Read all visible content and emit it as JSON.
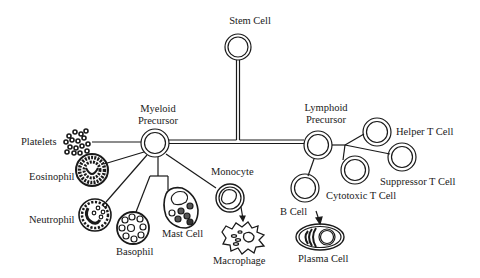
{
  "diagram": {
    "type": "cell-lineage-tree",
    "colors": {
      "line": "#1a1a1a",
      "background": "#ffffff"
    },
    "root": {
      "label": "Stem Cell"
    },
    "branches": {
      "myeloid": {
        "label_line1": "Myeloid",
        "label_line2": "Precursor",
        "children": [
          {
            "label": "Platelets"
          },
          {
            "label": "Eosinophil"
          },
          {
            "label": "Neutrophil"
          },
          {
            "label": "Basophil"
          },
          {
            "label": "Mast Cell"
          },
          {
            "label": "Monocyte",
            "differentiates_to": "Macrophage"
          }
        ],
        "macrophage": {
          "label": "Macrophage"
        }
      },
      "lymphoid": {
        "label_line1": "Lymphoid",
        "label_line2": "Precursor",
        "children": [
          {
            "label": "Helper T Cell"
          },
          {
            "label": "Suppressor T Cell"
          },
          {
            "label": "Cytotoxic T Cell"
          },
          {
            "label": "B Cell",
            "differentiates_to": "Plasma Cell"
          }
        ],
        "plasma": {
          "label": "Plasma Cell"
        }
      }
    }
  }
}
